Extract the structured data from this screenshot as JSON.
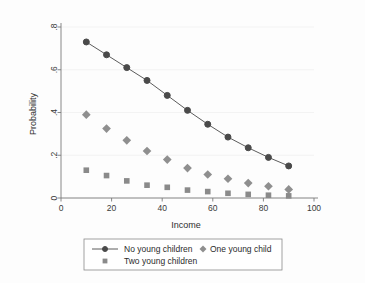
{
  "chart_data": {
    "type": "scatter",
    "title": "",
    "xlabel": "Income",
    "ylabel": "Probability",
    "xlim": [
      0,
      100
    ],
    "ylim": [
      0,
      0.8
    ],
    "xticks": [
      0,
      20,
      40,
      60,
      80,
      100
    ],
    "xtick_labels": [
      "0",
      "20",
      "40",
      "60",
      "80",
      "100"
    ],
    "yticks": [
      0,
      0.2,
      0.4,
      0.6,
      0.8
    ],
    "ytick_labels": [
      "0",
      ".2",
      ".4",
      ".6",
      ".8"
    ],
    "grid": "horizontal-faint",
    "legend_position": "below-axes",
    "x": [
      10,
      18,
      26,
      34,
      42,
      50,
      58,
      66,
      74,
      82,
      90
    ],
    "series": [
      {
        "name": "No young children",
        "marker": "circle",
        "line": true,
        "color": "#4a4a4a",
        "values": [
          0.73,
          0.67,
          0.61,
          0.55,
          0.48,
          0.41,
          0.345,
          0.285,
          0.235,
          0.19,
          0.15
        ]
      },
      {
        "name": "One young child",
        "marker": "diamond",
        "line": false,
        "color": "#8f8f8f",
        "values": [
          0.39,
          0.325,
          0.27,
          0.22,
          0.18,
          0.14,
          0.11,
          0.09,
          0.07,
          0.055,
          0.04
        ]
      },
      {
        "name": "Two young children",
        "marker": "square",
        "line": false,
        "color": "#8a8a8a",
        "values": [
          0.13,
          0.105,
          0.08,
          0.06,
          0.05,
          0.037,
          0.03,
          0.022,
          0.017,
          0.013,
          0.01
        ]
      }
    ]
  },
  "legend": {
    "entries": [
      {
        "label": "No young children",
        "marker": "circle-with-line"
      },
      {
        "label": "One young child",
        "marker": "diamond"
      },
      {
        "label": "Two young children",
        "marker": "square"
      }
    ]
  },
  "colors": {
    "axis": "#7a7a7a",
    "grid": "#eeeeee",
    "background": "#fdfdfd",
    "text": "#2b2b2b"
  }
}
